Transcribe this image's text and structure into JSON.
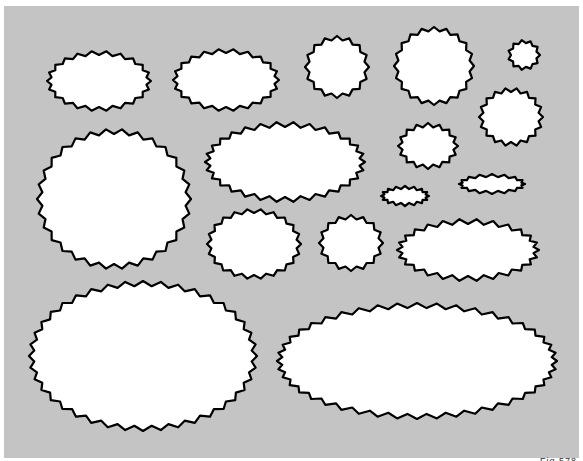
{
  "canvas": {
    "width": 583,
    "height": 461,
    "background": "#ffffff",
    "panel_color": "#c4c4c4",
    "stroke_color": "#000000",
    "fill_color": "#ffffff"
  },
  "caption": "Fig 578",
  "shapes": [
    {
      "name": "oval-top-1",
      "cx": 99,
      "cy": 81,
      "rx": 52,
      "ry": 30,
      "points": 22,
      "depth": 4
    },
    {
      "name": "oval-top-2",
      "cx": 226,
      "cy": 80,
      "rx": 53,
      "ry": 31,
      "points": 22,
      "depth": 4
    },
    {
      "name": "circle-top-1",
      "cx": 337,
      "cy": 67,
      "rx": 32,
      "ry": 31,
      "points": 16,
      "depth": 4
    },
    {
      "name": "circle-top-2",
      "cx": 434,
      "cy": 66,
      "rx": 40,
      "ry": 39,
      "points": 20,
      "depth": 4
    },
    {
      "name": "circle-small",
      "cx": 524,
      "cy": 55,
      "rx": 16,
      "ry": 15,
      "points": 11,
      "depth": 3
    },
    {
      "name": "circle-large",
      "cx": 114,
      "cy": 199,
      "rx": 77,
      "ry": 70,
      "points": 30,
      "depth": 5
    },
    {
      "name": "oval-middle",
      "cx": 285,
      "cy": 162,
      "rx": 80,
      "ry": 40,
      "points": 30,
      "depth": 5
    },
    {
      "name": "circle-mid-1",
      "cx": 428,
      "cy": 146,
      "rx": 30,
      "ry": 23,
      "points": 16,
      "depth": 4
    },
    {
      "name": "circle-mid-2",
      "cx": 511,
      "cy": 117,
      "rx": 32,
      "ry": 29,
      "points": 18,
      "depth": 4
    },
    {
      "name": "oval-thin-1",
      "cx": 405,
      "cy": 196,
      "rx": 24,
      "ry": 10,
      "points": 16,
      "depth": 3
    },
    {
      "name": "oval-thin-2",
      "cx": 492,
      "cy": 184,
      "rx": 33,
      "ry": 10,
      "points": 16,
      "depth": 3
    },
    {
      "name": "oval-mid-3",
      "cx": 254,
      "cy": 244,
      "rx": 47,
      "ry": 35,
      "points": 22,
      "depth": 4
    },
    {
      "name": "circle-mid-3",
      "cx": 351,
      "cy": 243,
      "rx": 32,
      "ry": 28,
      "points": 16,
      "depth": 4
    },
    {
      "name": "oval-mid-4",
      "cx": 468,
      "cy": 250,
      "rx": 71,
      "ry": 31,
      "points": 26,
      "depth": 5
    },
    {
      "name": "oval-bottom-left",
      "cx": 143,
      "cy": 356,
      "rx": 114,
      "ry": 75,
      "points": 40,
      "depth": 5
    },
    {
      "name": "oval-bottom-right",
      "cx": 417,
      "cy": 361,
      "rx": 140,
      "ry": 58,
      "points": 44,
      "depth": 5
    }
  ]
}
